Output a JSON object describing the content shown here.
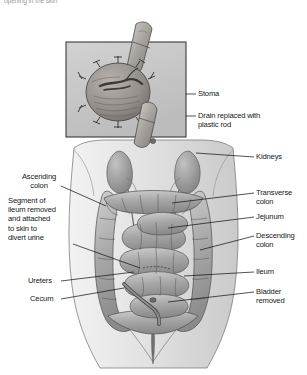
{
  "figure": {
    "title_fragment_cut_off_top": "opening in the skin",
    "background_color": "#ffffff",
    "ink_color": "#15181a",
    "inset_panel": {
      "fill_color": "#c9c9c9",
      "border_color": "#3a3a3a",
      "depicts": "close-up of ileal conduit stoma with sutures and supporting plastic rod"
    },
    "main_illustration": {
      "depicts": "anterior view of abdomen showing large intestine, kidneys, ureters and ileal conduit urinary diversion",
      "tone_color": "#b4b4b4"
    }
  },
  "labels": {
    "inset": [
      {
        "id": "stoma",
        "text": "Stoma"
      },
      {
        "id": "drain-rod",
        "text": "Drain replaced with\nplastic rod"
      }
    ],
    "left": [
      {
        "id": "ascending-colon",
        "text": "Ascending\ncolon"
      },
      {
        "id": "ileum-segment",
        "text": "Segment of\nileum removed\nand attached\nto skin to\ndivert urine"
      },
      {
        "id": "ureters",
        "text": "Ureters"
      },
      {
        "id": "cecum",
        "text": "Cecum"
      }
    ],
    "right": [
      {
        "id": "kidneys",
        "text": "Kidneys"
      },
      {
        "id": "transverse-colon",
        "text": "Transverse\ncolon"
      },
      {
        "id": "jejunum",
        "text": "Jejunum"
      },
      {
        "id": "descending-colon",
        "text": "Descending\ncolon"
      },
      {
        "id": "ileum",
        "text": "Ileum"
      },
      {
        "id": "bladder-removed",
        "text": "Bladder\nremoved"
      }
    ]
  }
}
